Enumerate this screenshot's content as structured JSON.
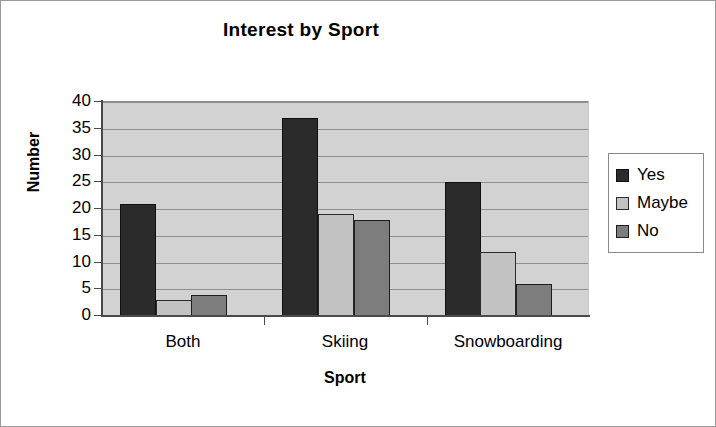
{
  "chart_data": {
    "type": "bar",
    "title": "Interest by Sport",
    "xlabel": "Sport",
    "ylabel": "Number",
    "categories": [
      "Both",
      "Skiing",
      "Snowboarding"
    ],
    "series": [
      {
        "name": "Yes",
        "color": "#2b2b2b",
        "values": [
          21,
          37,
          25
        ]
      },
      {
        "name": "Maybe",
        "color": "#c2c2c2",
        "values": [
          3,
          19,
          12
        ]
      },
      {
        "name": "No",
        "color": "#7d7d7d",
        "values": [
          4,
          18,
          6
        ]
      }
    ],
    "ylim": [
      0,
      40
    ],
    "ytick_values": [
      0,
      5,
      10,
      15,
      20,
      25,
      30,
      35,
      40
    ],
    "ytick_labels": [
      "0",
      "5",
      "10",
      "15",
      "20",
      "25",
      "30",
      "35",
      "40"
    ],
    "grid": true,
    "grid_axis": "y",
    "legend_position": "right",
    "plot_background": "#d2d2d2",
    "figure_background": "#ffffff"
  }
}
